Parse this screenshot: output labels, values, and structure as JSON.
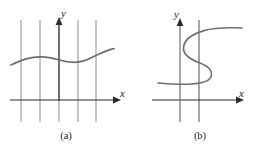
{
  "figure": {
    "width": 272,
    "height": 153,
    "background_color": "#ffffff",
    "curve_color": "#6e6e73",
    "axis_color": "#2b2b2b",
    "test_line_color": "#8d8d92"
  },
  "panels": [
    {
      "id": "a",
      "caption": "(a)",
      "x_axis_label": "x",
      "y_axis_label": "y",
      "description": "Gently undulating curve crossed once by each of five vertical lines",
      "vertical_test_lines": [
        {
          "x": 21,
          "y_top": 20,
          "y_bottom": 122
        },
        {
          "x": 40,
          "y_top": 20,
          "y_bottom": 122
        },
        {
          "x": 59,
          "y_top": 20,
          "y_bottom": 122
        },
        {
          "x": 78,
          "y_top": 20,
          "y_bottom": 122
        },
        {
          "x": 96,
          "y_top": 20,
          "y_bottom": 122
        }
      ],
      "axes": {
        "x_axis": {
          "x_start": 10,
          "x_end": 115,
          "y": 100,
          "arrow": "right"
        },
        "y_axis": {
          "y_start": 97,
          "y_end": 20,
          "x": 59,
          "arrow": "up"
        }
      },
      "curve_points": [
        [
          12,
          64
        ],
        [
          22,
          61
        ],
        [
          32,
          58
        ],
        [
          42,
          57
        ],
        [
          52,
          58
        ],
        [
          62,
          61
        ],
        [
          72,
          62
        ],
        [
          82,
          62
        ],
        [
          92,
          59
        ],
        [
          102,
          54
        ],
        [
          112,
          50
        ]
      ]
    },
    {
      "id": "b",
      "caption": "(b)",
      "x_axis_label": "x",
      "y_axis_label": "y",
      "description": "Backwards-S curve crossed three times by a single vertical line",
      "vertical_test_lines": [
        {
          "x": 63,
          "y_top": 20,
          "y_bottom": 122
        }
      ],
      "axes": {
        "x_axis": {
          "x_start": 16,
          "x_end": 102,
          "y": 100,
          "arrow": "right"
        },
        "y_axis": {
          "y_start": 122,
          "y_end": 20,
          "x": 44,
          "arrow": "up"
        }
      },
      "curve_points": [
        [
          102,
          28
        ],
        [
          88,
          28
        ],
        [
          74,
          29
        ],
        [
          64,
          32
        ],
        [
          55,
          37
        ],
        [
          49,
          44
        ],
        [
          48,
          52
        ],
        [
          53,
          58
        ],
        [
          62,
          62
        ],
        [
          70,
          67
        ],
        [
          73,
          74
        ],
        [
          69,
          80
        ],
        [
          59,
          83
        ],
        [
          46,
          84
        ],
        [
          33,
          83
        ],
        [
          22,
          82
        ]
      ]
    }
  ]
}
